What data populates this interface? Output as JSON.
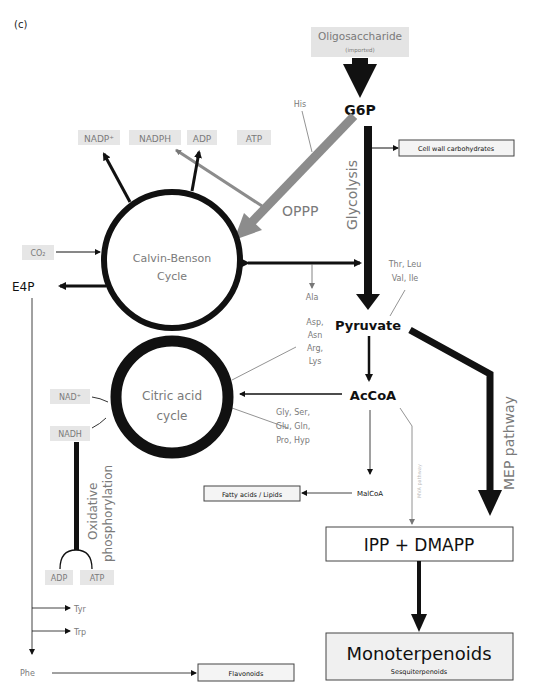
{
  "panel_label": "(c)",
  "source": {
    "title": "Oligosaccharide",
    "subtitle": "(imported)"
  },
  "metabolites": {
    "g6p": "G6P",
    "pyruvate": "Pyruvate",
    "accoa": "AcCoA",
    "malcoa": "MalCoA",
    "e4p": "E4P",
    "phe": "Phe",
    "tyr": "Tyr",
    "trp": "Trp"
  },
  "cofactors": {
    "nadp_plus": "NADP⁺",
    "nadph": "NADPH",
    "adp_top": "ADP",
    "atp_top": "ATP",
    "co2": "CO₂",
    "nad_plus": "NAD⁺",
    "nadh": "NADH",
    "adp_bottom": "ADP",
    "atp_bottom": "ATP"
  },
  "amino_acids": {
    "his": "His",
    "ala": "Ala",
    "thr_leu": "Thr, Leu",
    "val_ile": "Val, Ile",
    "asp_group": [
      "Asp,",
      "Asn",
      "Arg,",
      "Lys"
    ],
    "gly_group": [
      "Gly, Ser,",
      "Glu, Gln,",
      "Pro, Hyp"
    ]
  },
  "cycles": {
    "calvin": [
      "Calvin-Benson",
      "Cycle"
    ],
    "citric": [
      "Citric acid",
      "cycle"
    ]
  },
  "pathways": {
    "oppp": "OPPP",
    "glycolysis": "Glycolysis",
    "mep": "MEP pathway",
    "mva": "MVA pathway",
    "oxphos": [
      "Oxidative",
      "phosphorylation"
    ]
  },
  "products": {
    "cell_wall": "Cell wall carbohydrates",
    "fatty_acids": "Fatty acids / Lipids",
    "flavonoids": "Flavonoids",
    "ipp_dmapp": "IPP + DMAPP",
    "monoterpenoids": "Monoterpenoids",
    "sesquiterpenoids": "Sesquiterpenoids"
  },
  "colors": {
    "main": "#111111",
    "oppp": "#8c8c8c",
    "label_gray": "#7a7a7a",
    "shade": "#e6e6e6"
  }
}
